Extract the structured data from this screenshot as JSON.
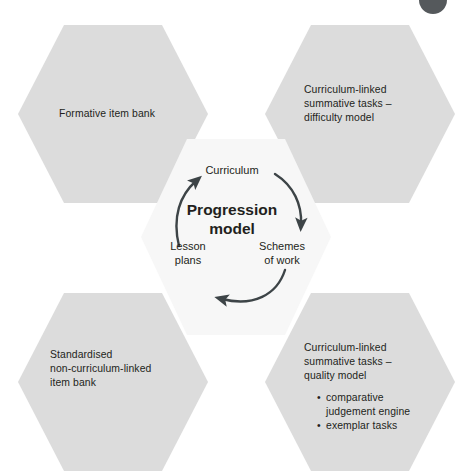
{
  "diagram": {
    "background_color": "#ffffff",
    "hex_fill": "#dcdcdc",
    "hex_fill_center": "#f7f7f7",
    "text_color": "#231f20",
    "arrow_color": "#3d4447",
    "corner_dot_color": "#55595c"
  },
  "corner_marker": {
    "name": "page-marker-dot"
  },
  "hexagons": [
    {
      "id": "formative-item-bank",
      "position": "top-left",
      "lines": [
        "Formative item bank"
      ],
      "bullets": []
    },
    {
      "id": "curriculum-linked-difficulty",
      "position": "top-right",
      "lines": [
        "Curriculum-linked",
        "summative tasks –",
        "difficulty model"
      ],
      "bullets": []
    },
    {
      "id": "standardised-non-curriculum-linked",
      "position": "bottom-left",
      "lines": [
        "Standardised",
        "non-curriculum-linked",
        "item bank"
      ],
      "bullets": []
    },
    {
      "id": "curriculum-linked-quality",
      "position": "bottom-right",
      "lines": [
        "Curriculum-linked",
        "summative tasks –",
        "quality model"
      ],
      "bullets": [
        {
          "line1": "comparative",
          "line2": "judgement engine"
        },
        {
          "line1": "exemplar tasks",
          "line2": ""
        }
      ]
    }
  ],
  "centre": {
    "id": "progression-model",
    "title_line1": "Progression",
    "title_line2": "model",
    "cycle_nodes": [
      {
        "id": "curriculum",
        "label": "Curriculum"
      },
      {
        "id": "schemes-of-work",
        "label_line1": "Schemes",
        "label_line2": "of work"
      },
      {
        "id": "lesson-plans",
        "label_line1": "Lesson",
        "label_line2": "plans"
      }
    ],
    "cycle_direction": "clockwise",
    "arrows": [
      {
        "id": "arrow-curriculum-to-schemes",
        "from": "curriculum",
        "to": "schemes-of-work"
      },
      {
        "id": "arrow-schemes-to-lesson",
        "from": "schemes-of-work",
        "to": "lesson-plans"
      },
      {
        "id": "arrow-lesson-to-curriculum",
        "from": "lesson-plans",
        "to": "curriculum"
      }
    ]
  }
}
